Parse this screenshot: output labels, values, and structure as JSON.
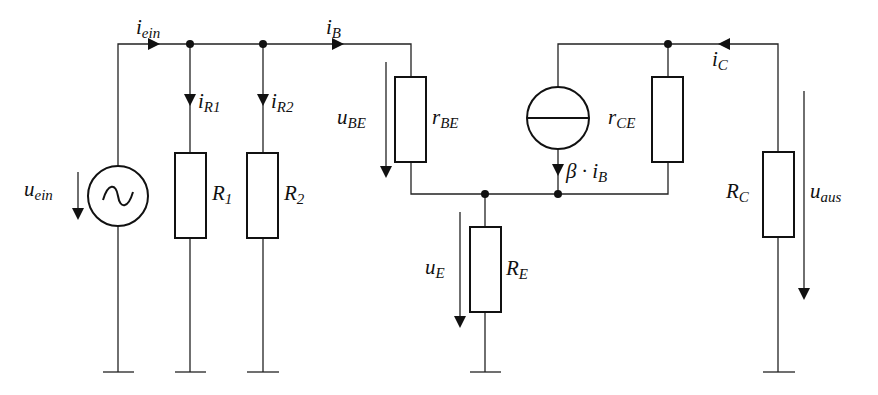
{
  "diagram": {
    "type": "small-signal equivalent circuit",
    "components": {
      "source": {
        "name": "u",
        "sub": "ein"
      },
      "R1": {
        "name": "R",
        "sub": "1"
      },
      "R2": {
        "name": "R",
        "sub": "2"
      },
      "rBE": {
        "name": "r",
        "sub": "BE"
      },
      "rCE": {
        "name": "r",
        "sub": "CE"
      },
      "RE": {
        "name": "R",
        "sub": "E"
      },
      "RC": {
        "name": "R",
        "sub": "C"
      }
    },
    "currents": {
      "i_ein": {
        "name": "i",
        "sub": "ein"
      },
      "i_R1": {
        "name": "i",
        "sub": "R1"
      },
      "i_R2": {
        "name": "i",
        "sub": "R2"
      },
      "i_B": {
        "name": "i",
        "sub": "B"
      },
      "i_C": {
        "name": "i",
        "sub": "C"
      },
      "beta_iB": {
        "name": "β · i",
        "sub": "B"
      }
    },
    "voltages": {
      "u_ein": {
        "name": "u",
        "sub": "ein"
      },
      "u_BE": {
        "name": "u",
        "sub": "BE"
      },
      "u_E": {
        "name": "u",
        "sub": "E"
      },
      "u_aus": {
        "name": "u",
        "sub": "aus"
      }
    }
  }
}
